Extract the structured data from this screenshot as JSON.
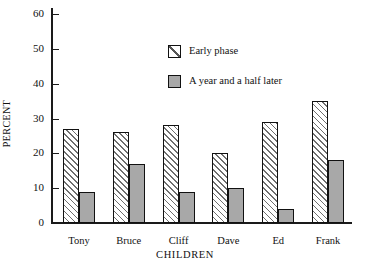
{
  "chart_data": {
    "type": "bar",
    "title": "",
    "xlabel": "CHILDREN",
    "ylabel": "PERCENT",
    "categories": [
      "Tony",
      "Bruce",
      "Cliff",
      "Dave",
      "Ed",
      "Frank"
    ],
    "series": [
      {
        "name": "Early phase",
        "values": [
          27,
          26,
          28,
          20,
          29,
          35
        ],
        "fill": "hatched",
        "color": "#ffffff"
      },
      {
        "name": "A year and a half later",
        "values": [
          9,
          17,
          9,
          10,
          4,
          18
        ],
        "fill": "solid",
        "color": "#a8a8a8"
      }
    ],
    "ylim": [
      0,
      60
    ],
    "yticks": [
      0,
      10,
      20,
      30,
      40,
      50,
      60
    ],
    "ytick_labels": [
      "0",
      "10",
      "20",
      "30",
      "40",
      "50",
      "60"
    ],
    "grid": false,
    "legend_position": "upper-center-inside",
    "axis_color": "#111111",
    "bar_edge_color": "#111111"
  },
  "legend": {
    "entries": [
      {
        "label": "Early phase"
      },
      {
        "label": "A year and a half later"
      }
    ]
  }
}
